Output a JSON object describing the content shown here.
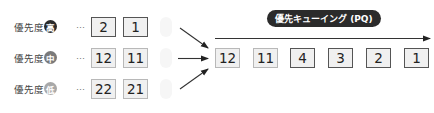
{
  "title": "優先キューイング (PQ)",
  "priority_rows": [
    {
      "label": "優先度",
      "level": "高",
      "badge_color": "#2b2b2b",
      "ellipsis": "…",
      "items": [
        "2",
        "1"
      ],
      "border": "dark"
    },
    {
      "label": "優先度",
      "level": "中",
      "badge_color": "#7a7a7a",
      "ellipsis": "…",
      "items": [
        "12",
        "11"
      ],
      "border": "light"
    },
    {
      "label": "優先度",
      "level": "低",
      "badge_color": "#a8a8a8",
      "ellipsis": "…",
      "items": [
        "22",
        "21"
      ],
      "border": "light"
    }
  ],
  "queue": {
    "items": [
      {
        "value": "12",
        "border": "light"
      },
      {
        "value": "11",
        "border": "light"
      },
      {
        "value": "4",
        "border": "dark"
      },
      {
        "value": "3",
        "border": "dark"
      },
      {
        "value": "2",
        "border": "dark"
      },
      {
        "value": "1",
        "border": "dark"
      }
    ],
    "direction_icon": "arrow-right-icon"
  }
}
